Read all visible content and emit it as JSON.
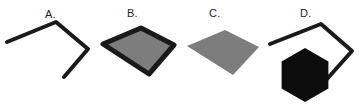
{
  "figure": {
    "background_color": "#ffffff",
    "width": 363,
    "height": 111,
    "stroke_color": "#1a1a1a",
    "fill_gray": "#7d7d7d",
    "fill_black": "#0d0d0d"
  },
  "panels": [
    {
      "id": "a",
      "label": "A.",
      "shape_name": "open-polyline-outline",
      "description": "Unclosed quadrilateral outline drawn as a thick black polyline",
      "filled": false,
      "outlined": true,
      "fill_color": "none",
      "stroke_color": "#1a1a1a",
      "stroke_width": 4,
      "points": "7,42 56,22 88,49 64,77"
    },
    {
      "id": "b",
      "label": "B.",
      "shape_name": "gray-quadrilateral-outlined",
      "description": "Gray-filled quadrilateral with a thick black outline",
      "filled": true,
      "outlined": true,
      "fill_color": "#7d7d7d",
      "stroke_color": "#1a1a1a",
      "stroke_width": 5,
      "points": "8,44 46,28 79,45 54,74"
    },
    {
      "id": "c",
      "label": "C.",
      "shape_name": "gray-quadrilateral-unoutlined",
      "description": "Gray-filled quadrilateral with no outline",
      "filled": true,
      "outlined": false,
      "fill_color": "#7d7d7d",
      "stroke_color": "none",
      "stroke_width": 0,
      "points": "2,46 40,30 74,47 48,75"
    },
    {
      "id": "d",
      "label": "D.",
      "shape_name": "open-polyline-with-black-hexagon",
      "description": "Same open quadrilateral outline as A, overlapped by a solid black pointy-top hexagon",
      "filled": false,
      "outlined": true,
      "fill_color": "none",
      "stroke_color": "#1a1a1a",
      "stroke_width": 4,
      "points": "5,44 56,24 87,51 62,79",
      "occluder": {
        "shape_name": "hexagon",
        "orientation": "pointy-top",
        "fill_color": "#0d0d0d",
        "center_x": 40,
        "center_y": 75,
        "radius": 27
      }
    }
  ]
}
